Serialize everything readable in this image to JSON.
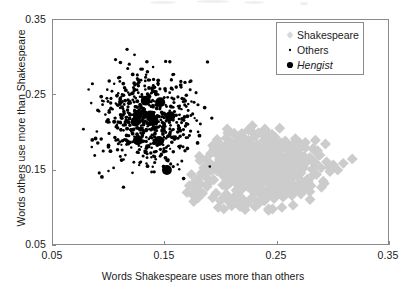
{
  "chart_data": {
    "type": "scatter",
    "title": "",
    "xlabel": "Words Shakespeare uses more than others",
    "ylabel": "Words others use more than Shakespeare",
    "xlim": [
      0.05,
      0.35
    ],
    "ylim": [
      0.05,
      0.35
    ],
    "xticks": [
      "0.05",
      "0.15",
      "0.25",
      "0.35"
    ],
    "yticks": [
      "0.05",
      "0.15",
      "0.25",
      "0.35"
    ],
    "xtick_values": [
      0.05,
      0.15,
      0.25,
      0.35
    ],
    "ytick_values": [
      0.05,
      0.15,
      0.25,
      0.35
    ],
    "grid": false,
    "legend_position": "top-right",
    "series": [
      {
        "name": "Shakespeare",
        "marker": "diamond",
        "color": "#cccccc",
        "size": 5.5,
        "points": [
          [
            0.196,
            0.171
          ],
          [
            0.199,
            0.163
          ],
          [
            0.201,
            0.182
          ],
          [
            0.203,
            0.155
          ],
          [
            0.205,
            0.145
          ],
          [
            0.206,
            0.168
          ],
          [
            0.208,
            0.176
          ],
          [
            0.209,
            0.133
          ],
          [
            0.21,
            0.159
          ],
          [
            0.212,
            0.15
          ],
          [
            0.213,
            0.185
          ],
          [
            0.214,
            0.166
          ],
          [
            0.215,
            0.141
          ],
          [
            0.216,
            0.173
          ],
          [
            0.217,
            0.126
          ],
          [
            0.218,
            0.157
          ],
          [
            0.219,
            0.147
          ],
          [
            0.22,
            0.18
          ],
          [
            0.221,
            0.163
          ],
          [
            0.222,
            0.136
          ],
          [
            0.223,
            0.171
          ],
          [
            0.224,
            0.152
          ],
          [
            0.225,
            0.189
          ],
          [
            0.226,
            0.144
          ],
          [
            0.227,
            0.166
          ],
          [
            0.228,
            0.158
          ],
          [
            0.229,
            0.131
          ],
          [
            0.23,
            0.175
          ],
          [
            0.231,
            0.149
          ],
          [
            0.232,
            0.162
          ],
          [
            0.233,
            0.183
          ],
          [
            0.234,
            0.14
          ],
          [
            0.235,
            0.17
          ],
          [
            0.236,
            0.155
          ],
          [
            0.237,
            0.124
          ],
          [
            0.238,
            0.164
          ],
          [
            0.239,
            0.147
          ],
          [
            0.24,
            0.178
          ],
          [
            0.241,
            0.159
          ],
          [
            0.242,
            0.138
          ],
          [
            0.243,
            0.169
          ],
          [
            0.244,
            0.152
          ],
          [
            0.245,
            0.186
          ],
          [
            0.246,
            0.143
          ],
          [
            0.247,
            0.165
          ],
          [
            0.248,
            0.156
          ],
          [
            0.249,
            0.129
          ],
          [
            0.25,
            0.174
          ],
          [
            0.251,
            0.148
          ],
          [
            0.252,
            0.161
          ],
          [
            0.253,
            0.181
          ],
          [
            0.254,
            0.139
          ],
          [
            0.255,
            0.168
          ],
          [
            0.256,
            0.153
          ],
          [
            0.257,
            0.122
          ],
          [
            0.258,
            0.163
          ],
          [
            0.259,
            0.146
          ],
          [
            0.26,
            0.176
          ],
          [
            0.261,
            0.157
          ],
          [
            0.262,
            0.135
          ],
          [
            0.263,
            0.167
          ],
          [
            0.264,
            0.151
          ],
          [
            0.265,
            0.184
          ],
          [
            0.266,
            0.142
          ],
          [
            0.267,
            0.16
          ],
          [
            0.268,
            0.154
          ],
          [
            0.269,
            0.128
          ],
          [
            0.27,
            0.172
          ],
          [
            0.272,
            0.145
          ],
          [
            0.274,
            0.162
          ],
          [
            0.276,
            0.179
          ],
          [
            0.278,
            0.137
          ],
          [
            0.28,
            0.166
          ],
          [
            0.282,
            0.15
          ],
          [
            0.284,
            0.158
          ],
          [
            0.286,
            0.143
          ],
          [
            0.288,
            0.169
          ],
          [
            0.29,
            0.152
          ],
          [
            0.292,
            0.134
          ],
          [
            0.295,
            0.16
          ],
          [
            0.298,
            0.147
          ],
          [
            0.301,
            0.156
          ],
          [
            0.305,
            0.149
          ],
          [
            0.31,
            0.158
          ],
          [
            0.318,
            0.164
          ],
          [
            0.192,
            0.148
          ],
          [
            0.194,
            0.136
          ],
          [
            0.19,
            0.159
          ],
          [
            0.188,
            0.127
          ],
          [
            0.186,
            0.141
          ],
          [
            0.184,
            0.118
          ],
          [
            0.182,
            0.131
          ],
          [
            0.18,
            0.112
          ],
          [
            0.196,
            0.118
          ],
          [
            0.2,
            0.108
          ],
          [
            0.204,
            0.115
          ],
          [
            0.208,
            0.106
          ],
          [
            0.212,
            0.113
          ],
          [
            0.216,
            0.103
          ],
          [
            0.22,
            0.11
          ],
          [
            0.224,
            0.104
          ],
          [
            0.228,
            0.112
          ],
          [
            0.232,
            0.107
          ],
          [
            0.236,
            0.116
          ],
          [
            0.24,
            0.109
          ],
          [
            0.244,
            0.118
          ],
          [
            0.248,
            0.111
          ],
          [
            0.252,
            0.119
          ],
          [
            0.256,
            0.113
          ],
          [
            0.26,
            0.121
          ],
          [
            0.264,
            0.115
          ],
          [
            0.268,
            0.123
          ],
          [
            0.272,
            0.117
          ],
          [
            0.276,
            0.126
          ],
          [
            0.28,
            0.12
          ],
          [
            0.205,
            0.192
          ],
          [
            0.213,
            0.196
          ],
          [
            0.222,
            0.191
          ],
          [
            0.231,
            0.194
          ],
          [
            0.24,
            0.19
          ],
          [
            0.249,
            0.193
          ],
          [
            0.258,
            0.188
          ],
          [
            0.267,
            0.191
          ],
          [
            0.276,
            0.186
          ],
          [
            0.285,
            0.189
          ],
          [
            0.294,
            0.184
          ],
          [
            0.207,
            0.2
          ],
          [
            0.219,
            0.198
          ],
          [
            0.234,
            0.199
          ],
          [
            0.246,
            0.197
          ],
          [
            0.211,
            0.178
          ],
          [
            0.226,
            0.18
          ],
          [
            0.239,
            0.177
          ],
          [
            0.254,
            0.179
          ],
          [
            0.269,
            0.176
          ],
          [
            0.283,
            0.178
          ],
          [
            0.217,
            0.169
          ],
          [
            0.233,
            0.171
          ],
          [
            0.247,
            0.168
          ],
          [
            0.261,
            0.17
          ],
          [
            0.275,
            0.167
          ],
          [
            0.289,
            0.169
          ],
          [
            0.202,
            0.129
          ],
          [
            0.218,
            0.132
          ],
          [
            0.235,
            0.127
          ],
          [
            0.251,
            0.13
          ],
          [
            0.266,
            0.125
          ],
          [
            0.281,
            0.128
          ],
          [
            0.293,
            0.131
          ],
          [
            0.199,
            0.175
          ],
          [
            0.209,
            0.187
          ],
          [
            0.227,
            0.185
          ],
          [
            0.243,
            0.182
          ],
          [
            0.259,
            0.184
          ],
          [
            0.273,
            0.181
          ],
          [
            0.287,
            0.175
          ],
          [
            0.215,
            0.16
          ],
          [
            0.229,
            0.163
          ],
          [
            0.245,
            0.158
          ],
          [
            0.257,
            0.161
          ],
          [
            0.271,
            0.156
          ],
          [
            0.285,
            0.159
          ],
          [
            0.297,
            0.153
          ],
          [
            0.191,
            0.171
          ],
          [
            0.193,
            0.182
          ],
          [
            0.197,
            0.19
          ],
          [
            0.206,
            0.204
          ],
          [
            0.225,
            0.203
          ],
          [
            0.241,
            0.201
          ],
          [
            0.253,
            0.205
          ],
          [
            0.214,
            0.122
          ],
          [
            0.23,
            0.119
          ],
          [
            0.244,
            0.124
          ],
          [
            0.259,
            0.117
          ],
          [
            0.274,
            0.122
          ],
          [
            0.189,
            0.148
          ],
          [
            0.187,
            0.163
          ],
          [
            0.185,
            0.152
          ],
          [
            0.183,
            0.145
          ],
          [
            0.181,
            0.139
          ],
          [
            0.179,
            0.124
          ],
          [
            0.177,
            0.133
          ],
          [
            0.175,
            0.116
          ],
          [
            0.193,
            0.112
          ],
          [
            0.198,
            0.099
          ],
          [
            0.203,
            0.097
          ],
          [
            0.21,
            0.101
          ],
          [
            0.222,
            0.096
          ],
          [
            0.231,
            0.1
          ],
          [
            0.243,
            0.095
          ],
          [
            0.255,
            0.099
          ],
          [
            0.265,
            0.102
          ],
          [
            0.176,
            0.107
          ],
          [
            0.172,
            0.128
          ],
          [
            0.17,
            0.119
          ]
        ]
      },
      {
        "name": "Others",
        "marker": "dot",
        "color": "#000000",
        "size": 1.6,
        "cluster_center": [
          0.135,
          0.215
        ],
        "cluster_spread": [
          0.022,
          0.032
        ],
        "count": 620
      },
      {
        "name": "Hengist",
        "marker": "circle",
        "color": "#000000",
        "size": 5.0,
        "italic_label": true,
        "points": [
          [
            0.133,
            0.242
          ],
          [
            0.146,
            0.24
          ],
          [
            0.126,
            0.223
          ],
          [
            0.137,
            0.222
          ],
          [
            0.155,
            0.221
          ],
          [
            0.124,
            0.214
          ],
          [
            0.14,
            0.215
          ],
          [
            0.126,
            0.189
          ],
          [
            0.145,
            0.188
          ],
          [
            0.152,
            0.149
          ]
        ]
      }
    ]
  },
  "axes": {
    "x_ticks": [
      {
        "label": "0.05",
        "value": 0.05
      },
      {
        "label": "0.15",
        "value": 0.15
      },
      {
        "label": "0.25",
        "value": 0.25
      },
      {
        "label": "0.35",
        "value": 0.35
      }
    ],
    "y_ticks": [
      {
        "label": "0.05",
        "value": 0.05
      },
      {
        "label": "0.15",
        "value": 0.15
      },
      {
        "label": "0.25",
        "value": 0.25
      },
      {
        "label": "0.35",
        "value": 0.35
      }
    ]
  },
  "legend": {
    "items": [
      {
        "label": "Shakespeare",
        "marker": "diamond",
        "color": "#cccccc",
        "italic": false
      },
      {
        "label": "Others",
        "marker": "dot",
        "color": "#000000",
        "italic": false
      },
      {
        "label": "Hengist",
        "marker": "circle",
        "color": "#000000",
        "italic": true
      }
    ]
  },
  "colors": {
    "shakespeare": "#cccccc",
    "others": "#000000",
    "hengist": "#000000",
    "axis": "#8a8a8a",
    "text": "#1a1a1a"
  }
}
